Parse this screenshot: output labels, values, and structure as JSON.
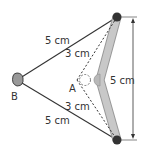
{
  "diagram": {
    "labels": {
      "point_a": "A",
      "point_b": "B",
      "top_left_side": "5 cm",
      "bottom_left_side": "5 cm",
      "top_inner_dashed": "3 cm",
      "bottom_inner_dashed": "3 cm",
      "vertical_span": "5 cm"
    },
    "colors": {
      "line": "#333333",
      "rod_fill": "#c8c8c8",
      "rod_stroke": "#999999",
      "pin": "#333333",
      "knob_fill": "#b0b0b0"
    }
  }
}
